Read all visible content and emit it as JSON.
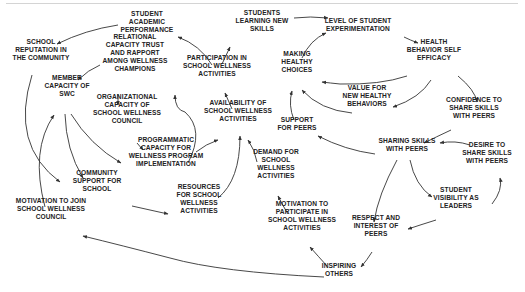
{
  "diagram": {
    "type": "causal-loop",
    "nodes": [
      {
        "id": "student_academic_performance",
        "lines": [
          "STUDENT",
          "ACADEMIC",
          "PERFORMANCE"
        ],
        "x": 147,
        "y": 22
      },
      {
        "id": "school_reputation",
        "lines": [
          "SCHOOL",
          "REPUTATION IN",
          "THE COMMUNITY"
        ],
        "x": 41,
        "y": 50
      },
      {
        "id": "relational_capacity",
        "lines": [
          "RELATIONAL",
          "CAPACITY TRUST",
          "AND RAPPORT",
          "AMONG WELLNESS",
          "CHAMPIONS"
        ],
        "x": 135,
        "y": 53
      },
      {
        "id": "member_capacity_swc",
        "lines": [
          "MEMBER",
          "CAPACITY OF",
          "SWC"
        ],
        "x": 67,
        "y": 86
      },
      {
        "id": "organizational_capacity",
        "lines": [
          "ORGANIZATIONAL",
          "CAPACITY OF",
          "SCHOOL WELLNESS",
          "COUNCIL"
        ],
        "x": 127,
        "y": 109
      },
      {
        "id": "programmatic_capacity",
        "lines": [
          "PROGRAMMATIC",
          "CAPACITY FOR",
          "WELLNESS PROGRAM",
          "IMPLEMENTATION"
        ],
        "x": 166,
        "y": 152
      },
      {
        "id": "community_support",
        "lines": [
          "COMMUNITY",
          "SUPPORT FOR",
          "SCHOOL"
        ],
        "x": 97,
        "y": 181
      },
      {
        "id": "motivation_join_swc",
        "lines": [
          "MOTIVATION TO JOIN",
          "SCHOOL WELLNESS",
          "COUNCIL"
        ],
        "x": 51,
        "y": 209
      },
      {
        "id": "participation",
        "lines": [
          "PARTICIPATION IN",
          "SCHOOL WELLNESS",
          "ACTIVITIES"
        ],
        "x": 217,
        "y": 66
      },
      {
        "id": "students_learning",
        "lines": [
          "STUDENTS",
          "LEARNING NEW",
          "SKILLS"
        ],
        "x": 262,
        "y": 21
      },
      {
        "id": "availability",
        "lines": [
          "AVAILABILITY OF",
          "SCHOOL WELLNESS",
          "ACTIVITIES"
        ],
        "x": 238,
        "y": 111
      },
      {
        "id": "resources",
        "lines": [
          "RESOURCES",
          "FOR SCHOOL",
          "WELLNESS",
          "ACTIVITIES"
        ],
        "x": 199,
        "y": 199
      },
      {
        "id": "demand",
        "lines": [
          "DEMAND FOR",
          "SCHOOL",
          "WELLNESS",
          "ACTIVITIES"
        ],
        "x": 276,
        "y": 164
      },
      {
        "id": "motivation_participate",
        "lines": [
          "MOTIVATION TO",
          "PARTICIPATE IN",
          "SCHOOL WELLNESS",
          "ACTIVITIES"
        ],
        "x": 302,
        "y": 216
      },
      {
        "id": "inspiring_others",
        "lines": [
          "INSPIRING",
          "OTHERS"
        ],
        "x": 339,
        "y": 270
      },
      {
        "id": "making_healthy_choices",
        "lines": [
          "MAKING",
          "HEALTHY",
          "CHOICES"
        ],
        "x": 297,
        "y": 62
      },
      {
        "id": "level_experimentation",
        "lines": [
          "LEVEL OF STUDENT",
          "EXPERIMENTATION"
        ],
        "x": 358,
        "y": 25
      },
      {
        "id": "health_behavior_self_efficacy",
        "lines": [
          "HEALTH",
          "BEHAVIOR SELF",
          "EFFICACY"
        ],
        "x": 434,
        "y": 50
      },
      {
        "id": "value_new_behaviors",
        "lines": [
          "VALUE FOR",
          "NEW HEALTHY",
          "BEHAVIORS"
        ],
        "x": 367,
        "y": 96
      },
      {
        "id": "support_for_peers",
        "lines": [
          "SUPPORT",
          "FOR PEERS"
        ],
        "x": 297,
        "y": 124
      },
      {
        "id": "confidence_share",
        "lines": [
          "CONFIDENCE TO",
          "SHARE SKILLS",
          "WITH PEERS"
        ],
        "x": 474,
        "y": 108
      },
      {
        "id": "sharing_skills",
        "lines": [
          "SHARING SKILLS",
          "WITH PEERS"
        ],
        "x": 407,
        "y": 145
      },
      {
        "id": "desire_share",
        "lines": [
          "DESIRE TO",
          "SHARE SKILLS",
          "WITH PEERS"
        ],
        "x": 487,
        "y": 153
      },
      {
        "id": "student_visibility",
        "lines": [
          "STUDENT",
          "VISIBILITY AS",
          "LEADERS"
        ],
        "x": 456,
        "y": 198
      },
      {
        "id": "respect_interest",
        "lines": [
          "RESPECT AND",
          "INTEREST OF",
          "PEERS"
        ],
        "x": 376,
        "y": 226
      }
    ],
    "edges": [
      {
        "from": "student_academic_performance",
        "to": "school_reputation",
        "path": "M118 25 Q85 30 57 44"
      },
      {
        "from": "relational_capacity",
        "to": "member_capacity_swc",
        "path": "M100 65 Q88 70 78 80"
      },
      {
        "from": "relational_capacity",
        "to": "organizational_capacity",
        "path": "M118 94 L118 105"
      },
      {
        "from": "organizational_capacity",
        "to": "programmatic_capacity",
        "path": "M137 143 L143 150"
      },
      {
        "from": "member_capacity_swc",
        "to": "programmatic_capacity",
        "path": "M71 114 Q90 145 121 163"
      },
      {
        "from": "member_capacity_swc",
        "to": "community_support",
        "path": "M65 114 Q66 150 83 178"
      },
      {
        "from": "school_reputation",
        "to": "community_support",
        "path": "M32 75 Q10 145 60 182"
      },
      {
        "from": "motivation_join_swc",
        "to": "member_capacity_swc",
        "path": "M45 207 Q30 150 54 115"
      },
      {
        "from": "community_support",
        "to": "resources",
        "path": "M132 206 Q150 210 168 214"
      },
      {
        "from": "programmatic_capacity",
        "to": "participation",
        "path": "M188 163 Q205 130 185 112 Q175 110 175 95"
      },
      {
        "from": "programmatic_capacity",
        "to": "availability",
        "path": "M196 152 Q206 144 218 140"
      },
      {
        "from": "resources",
        "to": "availability",
        "path": "M218 198 Q240 180 240 136"
      },
      {
        "from": "demand",
        "to": "availability",
        "path": "M257 162 Q255 150 248 140"
      },
      {
        "from": "motivation_participate",
        "to": "demand",
        "path": "M288 214 Q283 206 278 196"
      },
      {
        "from": "inspiring_others",
        "to": "motivation_participate",
        "path": "M327 266 Q318 256 310 247"
      },
      {
        "from": "inspiring_others",
        "to": "motivation_join_swc",
        "path": "M324 277 Q220 272 170 258 Q120 245 83 236"
      },
      {
        "from": "availability",
        "to": "participation",
        "path": "M232 109 L225 93"
      },
      {
        "from": "participation",
        "to": "student_academic_performance",
        "path": "M212 65 Q200 45 178 37"
      },
      {
        "from": "participation",
        "to": "students_learning",
        "path": "M222 64 L230 47"
      },
      {
        "from": "students_learning",
        "to": "level_experimentation",
        "path": "M294 18 Q310 16 328 18"
      },
      {
        "from": "making_healthy_choices",
        "to": "level_experimentation",
        "path": "M302 58 Q310 40 326 33"
      },
      {
        "from": "level_experimentation",
        "to": "health_behavior_self_efficacy",
        "path": "M404 37 Q410 40 418 43"
      },
      {
        "from": "health_behavior_self_efficacy",
        "to": "making_healthy_choices",
        "path": "M407 76 Q380 85 340 84 Q330 83 322 82"
      },
      {
        "from": "health_behavior_self_efficacy",
        "to": "value_new_behaviors",
        "path": "M431 80 Q420 98 393 107"
      },
      {
        "from": "value_new_behaviors",
        "to": "making_healthy_choices",
        "path": "M352 113 Q320 110 302 90"
      },
      {
        "from": "health_behavior_self_efficacy",
        "to": "confidence_share",
        "path": "M458 76 Q475 90 477 102"
      },
      {
        "from": "support_for_peers",
        "to": "making_healthy_choices",
        "path": "M294 120 Q288 105 292 91"
      },
      {
        "from": "sharing_skills",
        "to": "support_for_peers",
        "path": "M375 154 Q345 150 318 136"
      },
      {
        "from": "confidence_share",
        "to": "sharing_skills",
        "path": "M451 130 Q436 137 424 143"
      },
      {
        "from": "desire_share",
        "to": "sharing_skills",
        "path": "M470 145 Q455 140 440 143"
      },
      {
        "from": "sharing_skills",
        "to": "respect_interest",
        "path": "M397 160 Q378 195 374 222"
      },
      {
        "from": "sharing_skills",
        "to": "student_visibility",
        "path": "M410 160 Q415 185 432 197"
      },
      {
        "from": "student_visibility",
        "to": "desire_share",
        "path": "M492 204 Q503 190 500 178"
      },
      {
        "from": "student_visibility",
        "to": "respect_interest",
        "path": "M436 220 Q420 225 408 229"
      },
      {
        "from": "respect_interest",
        "to": "inspiring_others",
        "path": "M372 252 Q367 260 361 267"
      }
    ]
  }
}
